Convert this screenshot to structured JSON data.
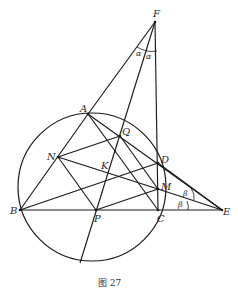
{
  "figure": {
    "caption": "图 27",
    "points": {
      "F": {
        "label": "F",
        "x": 155,
        "y": 22
      },
      "A": {
        "label": "A",
        "x": 88,
        "y": 114
      },
      "Q": {
        "label": "Q",
        "x": 120,
        "y": 136
      },
      "N": {
        "label": "N",
        "x": 58,
        "y": 157
      },
      "D": {
        "label": "D",
        "x": 158,
        "y": 163
      },
      "K": {
        "label": "K",
        "x": 105,
        "y": 170
      },
      "M": {
        "label": "M",
        "x": 158,
        "y": 189
      },
      "B": {
        "label": "B",
        "x": 20,
        "y": 210
      },
      "P": {
        "label": "P",
        "x": 96,
        "y": 210
      },
      "C": {
        "label": "C",
        "x": 158,
        "y": 210
      },
      "E": {
        "label": "E",
        "x": 222,
        "y": 210
      }
    },
    "circle": {
      "cx": 92,
      "cy": 187,
      "r": 74
    },
    "angle_labels": {
      "alpha_left": "α",
      "alpha_right": "α",
      "beta_upper": "β",
      "beta_lower": "β"
    },
    "segments": [
      "FA",
      "FQ",
      "FC",
      "AB",
      "AE",
      "AP",
      "AM",
      "NQ",
      "ND",
      "NP",
      "NE",
      "BD",
      "BE",
      "PM",
      "PQ",
      "DC",
      "ME"
    ]
  }
}
